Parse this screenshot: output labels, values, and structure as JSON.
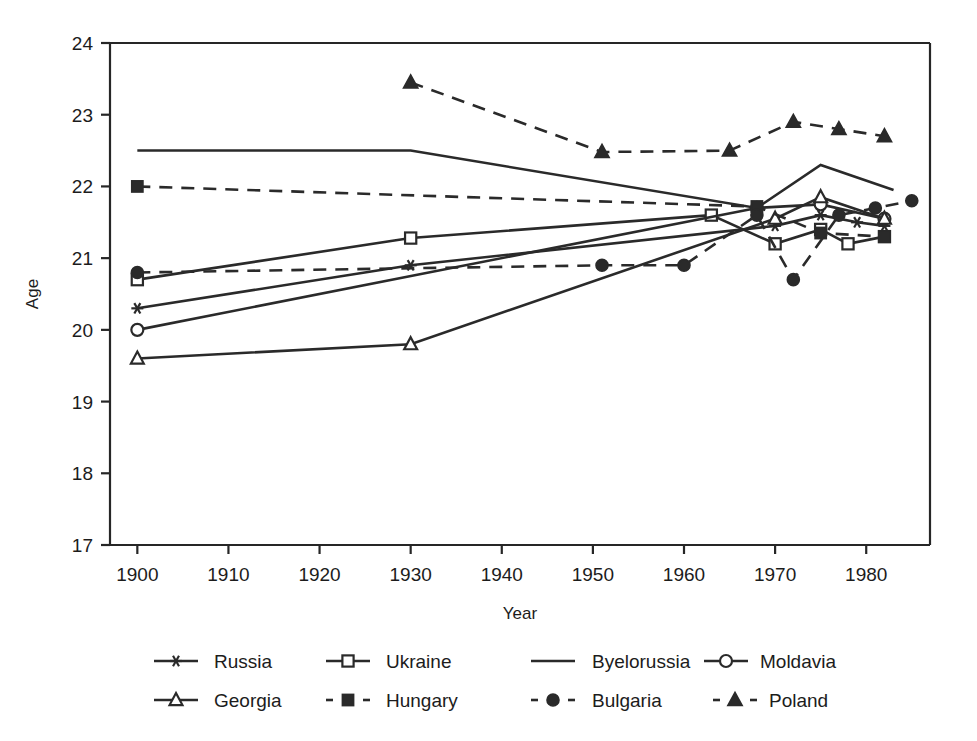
{
  "chart_data": {
    "type": "line",
    "title": "",
    "xlabel": "Year",
    "ylabel": "Age",
    "xlim": [
      1897,
      1987
    ],
    "ylim": [
      17,
      24
    ],
    "xticks": [
      1900,
      1910,
      1920,
      1930,
      1940,
      1950,
      1960,
      1970,
      1980
    ],
    "yticks": [
      17,
      18,
      19,
      20,
      21,
      22,
      23,
      24
    ],
    "grid": false,
    "legend_position": "below",
    "series": [
      {
        "name": "Russia",
        "marker": "asterisk",
        "linestyle": "solid",
        "x": [
          1900,
          1930,
          1970,
          1975,
          1979,
          1982
        ],
        "values": [
          20.3,
          20.9,
          21.45,
          21.6,
          21.5,
          21.45
        ]
      },
      {
        "name": "Ukraine",
        "marker": "open-square",
        "linestyle": "solid",
        "x": [
          1900,
          1930,
          1963,
          1970,
          1975,
          1978,
          1982
        ],
        "values": [
          20.7,
          21.28,
          21.6,
          21.2,
          21.4,
          21.2,
          21.3
        ]
      },
      {
        "name": "Byelorussia",
        "marker": "none",
        "linestyle": "solid",
        "x": [
          1900,
          1930,
          1968,
          1975,
          1983
        ],
        "values": [
          22.5,
          22.5,
          21.7,
          22.3,
          21.95
        ]
      },
      {
        "name": "Moldavia",
        "marker": "open-circle",
        "linestyle": "solid",
        "x": [
          1900,
          1968,
          1975,
          1982
        ],
        "values": [
          20.0,
          21.7,
          21.75,
          21.55
        ]
      },
      {
        "name": "Georgia",
        "marker": "open-triangle",
        "linestyle": "solid",
        "x": [
          1900,
          1930,
          1970,
          1975,
          1982
        ],
        "values": [
          19.6,
          19.8,
          21.55,
          21.85,
          21.55
        ]
      },
      {
        "name": "Hungary",
        "marker": "filled-square",
        "linestyle": "dashed",
        "x": [
          1900,
          1968,
          1975,
          1982
        ],
        "values": [
          22.0,
          21.72,
          21.35,
          21.3
        ]
      },
      {
        "name": "Bulgaria",
        "marker": "filled-circle",
        "linestyle": "dashed",
        "x": [
          1900,
          1951,
          1960,
          1968,
          1972,
          1977,
          1981,
          1985
        ],
        "values": [
          20.8,
          20.9,
          20.9,
          21.6,
          20.7,
          21.6,
          21.7,
          21.8
        ]
      },
      {
        "name": "Poland",
        "marker": "filled-triangle",
        "linestyle": "dashed",
        "x": [
          1930,
          1951,
          1965,
          1972,
          1977,
          1982
        ],
        "values": [
          23.45,
          22.48,
          22.5,
          22.9,
          22.8,
          22.7
        ]
      }
    ]
  },
  "axes": {
    "ylabel": "Age",
    "xlabel": "Year",
    "ytick_labels": [
      "24",
      "23",
      "22",
      "21",
      "20",
      "19",
      "18",
      "17"
    ],
    "xtick_labels": [
      "1900",
      "1910",
      "1920",
      "1930",
      "1940",
      "1950",
      "1960",
      "1970",
      "1980"
    ]
  },
  "legend": {
    "row1": [
      {
        "label": "Russia",
        "marker": "asterisk",
        "linestyle": "solid"
      },
      {
        "label": "Ukraine",
        "marker": "open-square",
        "linestyle": "solid"
      },
      {
        "label": "Byelorussia",
        "marker": "none",
        "linestyle": "solid"
      },
      {
        "label": "Moldavia",
        "marker": "open-circle",
        "linestyle": "solid"
      }
    ],
    "row2": [
      {
        "label": "Georgia",
        "marker": "open-triangle",
        "linestyle": "solid"
      },
      {
        "label": "Hungary",
        "marker": "filled-square",
        "linestyle": "dashed"
      },
      {
        "label": "Bulgaria",
        "marker": "filled-circle",
        "linestyle": "dashed"
      },
      {
        "label": "Poland",
        "marker": "filled-triangle",
        "linestyle": "dashed"
      }
    ]
  },
  "style": {
    "ink": "#2a2a2a",
    "background": "#ffffff"
  }
}
